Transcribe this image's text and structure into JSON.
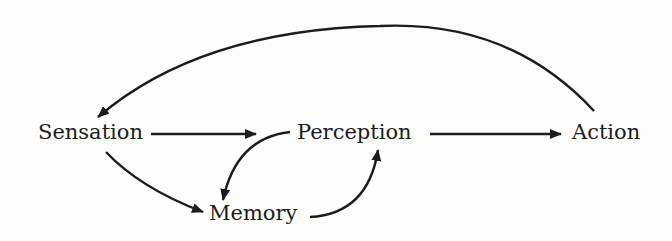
{
  "diagram": {
    "type": "flow",
    "colors": {
      "ink": "#1c1c1c",
      "background": "#fdfdfc"
    },
    "nodes": [
      {
        "id": "sensation",
        "label": "Sensation"
      },
      {
        "id": "perception",
        "label": "Perception"
      },
      {
        "id": "action",
        "label": "Action"
      },
      {
        "id": "memory",
        "label": "Memory"
      }
    ],
    "edges": [
      {
        "from": "sensation",
        "to": "perception"
      },
      {
        "from": "perception",
        "to": "action"
      },
      {
        "from": "sensation",
        "to": "memory"
      },
      {
        "from": "perception",
        "to": "memory"
      },
      {
        "from": "memory",
        "to": "perception"
      },
      {
        "from": "action",
        "to": "sensation"
      }
    ]
  }
}
